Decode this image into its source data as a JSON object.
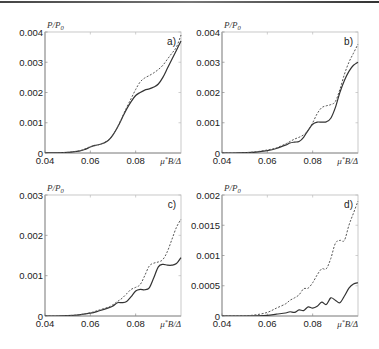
{
  "figure": {
    "top_rule": true
  },
  "chart_data": [
    {
      "type": "line",
      "panel": "a)",
      "title": "",
      "xlabel": "μ*B/Δ",
      "ylabel": "P/P0",
      "xlim": [
        0.04,
        0.1
      ],
      "ylim": [
        0,
        0.004
      ],
      "xticks": [
        "0.04",
        "0.06",
        "0.08"
      ],
      "xtick_values": [
        0.04,
        0.06,
        0.08
      ],
      "yticks": [
        "0",
        "0.001",
        "0.002",
        "0.003",
        "0.004"
      ],
      "ytick_values": [
        0,
        0.001,
        0.002,
        0.003,
        0.004
      ],
      "grid": false,
      "box": {
        "left": 45,
        "right": 181,
        "top": 32,
        "bottom": 153
      },
      "series": [
        {
          "name": "solid",
          "style": "solid",
          "x": [
            0.04,
            0.045,
            0.05,
            0.055,
            0.058,
            0.06,
            0.062,
            0.064,
            0.066,
            0.068,
            0.07,
            0.072,
            0.074,
            0.076,
            0.078,
            0.08,
            0.082,
            0.084,
            0.086,
            0.088,
            0.09,
            0.092,
            0.094,
            0.096,
            0.098,
            0.1
          ],
          "y": [
            0.0,
            5e-06,
            2e-05,
            6e-05,
            0.00013,
            0.0002,
            0.00025,
            0.00028,
            0.00033,
            0.00042,
            0.0006,
            0.00085,
            0.00115,
            0.00145,
            0.0017,
            0.0019,
            0.002,
            0.00208,
            0.00212,
            0.00218,
            0.00228,
            0.0025,
            0.0028,
            0.0031,
            0.0034,
            0.0037
          ]
        },
        {
          "name": "dashed",
          "style": "dashed",
          "x": [
            0.04,
            0.045,
            0.05,
            0.055,
            0.058,
            0.06,
            0.062,
            0.064,
            0.066,
            0.068,
            0.07,
            0.072,
            0.074,
            0.076,
            0.078,
            0.08,
            0.082,
            0.084,
            0.086,
            0.088,
            0.09,
            0.092,
            0.094,
            0.096,
            0.098,
            0.1
          ],
          "y": [
            0.0,
            5e-06,
            2e-05,
            7e-05,
            0.00015,
            0.00021,
            0.00024,
            0.00028,
            0.00034,
            0.00043,
            0.0006,
            0.00086,
            0.00118,
            0.0015,
            0.0018,
            0.0021,
            0.00235,
            0.00248,
            0.00256,
            0.00265,
            0.00276,
            0.0029,
            0.0031,
            0.0033,
            0.0035,
            0.0039
          ]
        }
      ]
    },
    {
      "type": "line",
      "panel": "b)",
      "title": "",
      "xlabel": "μ*B/Δ",
      "ylabel": "P/P0",
      "xlim": [
        0.04,
        0.1
      ],
      "ylim": [
        0,
        0.004
      ],
      "xticks": [
        "0.04",
        "0.06",
        "0.08"
      ],
      "xtick_values": [
        0.04,
        0.06,
        0.08
      ],
      "yticks": [
        "0",
        "0.001",
        "0.002",
        "0.003",
        "0.004"
      ],
      "ytick_values": [
        0,
        0.001,
        0.002,
        0.003,
        0.004
      ],
      "grid": false,
      "box": {
        "left": 222,
        "right": 358,
        "top": 32,
        "bottom": 153
      },
      "series": [
        {
          "name": "solid",
          "style": "solid",
          "x": [
            0.04,
            0.045,
            0.05,
            0.055,
            0.06,
            0.064,
            0.068,
            0.07,
            0.072,
            0.074,
            0.076,
            0.078,
            0.08,
            0.082,
            0.084,
            0.086,
            0.088,
            0.09,
            0.092,
            0.094,
            0.096,
            0.098,
            0.1
          ],
          "y": [
            0.0,
            0.0,
            1e-05,
            3e-05,
            8e-05,
            0.00015,
            0.00026,
            0.00033,
            0.00036,
            0.00038,
            0.00052,
            0.00075,
            0.00095,
            0.00102,
            0.00102,
            0.00103,
            0.00115,
            0.0015,
            0.002,
            0.0024,
            0.0027,
            0.0029,
            0.003
          ]
        },
        {
          "name": "dashed",
          "style": "dashed",
          "x": [
            0.04,
            0.045,
            0.05,
            0.055,
            0.06,
            0.064,
            0.068,
            0.07,
            0.072,
            0.074,
            0.076,
            0.078,
            0.08,
            0.082,
            0.084,
            0.086,
            0.088,
            0.09,
            0.092,
            0.094,
            0.096,
            0.098,
            0.1
          ],
          "y": [
            0.0,
            0.0,
            1e-05,
            4e-05,
            0.0001,
            0.00017,
            0.0003,
            0.00038,
            0.00046,
            0.00052,
            0.0006,
            0.00075,
            0.001,
            0.0013,
            0.0015,
            0.00156,
            0.0016,
            0.0017,
            0.0021,
            0.0026,
            0.003,
            0.0033,
            0.0036
          ]
        }
      ]
    },
    {
      "type": "line",
      "panel": "c)",
      "title": "",
      "xlabel": "μ*B/Δ",
      "ylabel": "P/P0",
      "xlim": [
        0.04,
        0.1
      ],
      "ylim": [
        0,
        0.003
      ],
      "xticks": [
        "0.04",
        "0.06",
        "0.08"
      ],
      "xtick_values": [
        0.04,
        0.06,
        0.08
      ],
      "yticks": [
        "0",
        "0.001",
        "0.002",
        "0.003"
      ],
      "ytick_values": [
        0,
        0.001,
        0.002,
        0.003
      ],
      "grid": false,
      "box": {
        "left": 45,
        "right": 181,
        "top": 195,
        "bottom": 316
      },
      "series": [
        {
          "name": "solid",
          "style": "solid",
          "x": [
            0.04,
            0.045,
            0.05,
            0.055,
            0.06,
            0.064,
            0.068,
            0.07,
            0.072,
            0.074,
            0.076,
            0.078,
            0.08,
            0.082,
            0.084,
            0.086,
            0.088,
            0.09,
            0.092,
            0.094,
            0.096,
            0.098,
            0.1
          ],
          "y": [
            0.0,
            0.0,
            1e-05,
            3e-05,
            7e-05,
            0.00013,
            0.0002,
            0.00025,
            0.00033,
            0.00033,
            0.00036,
            0.00048,
            0.00062,
            0.00066,
            0.00065,
            0.0007,
            0.00095,
            0.00122,
            0.00128,
            0.00126,
            0.00126,
            0.0013,
            0.00145
          ]
        },
        {
          "name": "dashed",
          "style": "dashed",
          "x": [
            0.04,
            0.045,
            0.05,
            0.055,
            0.06,
            0.064,
            0.068,
            0.07,
            0.072,
            0.074,
            0.076,
            0.078,
            0.08,
            0.082,
            0.084,
            0.086,
            0.088,
            0.09,
            0.092,
            0.094,
            0.096,
            0.098,
            0.1
          ],
          "y": [
            0.0,
            0.0,
            1e-05,
            3e-05,
            8e-05,
            0.00015,
            0.00022,
            0.00028,
            0.00036,
            0.00044,
            0.00055,
            0.00066,
            0.00071,
            0.00078,
            0.001,
            0.00124,
            0.00131,
            0.00134,
            0.0014,
            0.0016,
            0.0019,
            0.0022,
            0.0024
          ]
        }
      ]
    },
    {
      "type": "line",
      "panel": "d)",
      "title": "",
      "xlabel": "μ*B/Δ",
      "ylabel": "P/P0",
      "xlim": [
        0.04,
        0.1
      ],
      "ylim": [
        0,
        0.002
      ],
      "xticks": [
        "0.04",
        "0.06",
        "0.08"
      ],
      "xtick_values": [
        0.04,
        0.06,
        0.08
      ],
      "yticks": [
        "0",
        "0.0005",
        "0.001",
        "0.0015",
        "0.002"
      ],
      "ytick_values": [
        0,
        0.0005,
        0.001,
        0.0015,
        0.002
      ],
      "grid": false,
      "box": {
        "left": 222,
        "right": 358,
        "top": 195,
        "bottom": 316
      },
      "series": [
        {
          "name": "solid",
          "style": "solid",
          "x": [
            0.04,
            0.05,
            0.055,
            0.06,
            0.064,
            0.068,
            0.07,
            0.072,
            0.074,
            0.076,
            0.078,
            0.08,
            0.082,
            0.084,
            0.086,
            0.088,
            0.09,
            0.092,
            0.094,
            0.096,
            0.098,
            0.1
          ],
          "y": [
            0.0,
            0.0,
            3e-06,
            1e-05,
            3e-05,
            5e-05,
            7e-05,
            6e-05,
            0.0001,
            9e-05,
            0.00015,
            0.00013,
            0.00016,
            0.00023,
            0.00019,
            0.0003,
            0.00026,
            0.00022,
            0.00033,
            0.00046,
            0.00053,
            0.00055
          ]
        },
        {
          "name": "dashed",
          "style": "dashed",
          "x": [
            0.04,
            0.05,
            0.055,
            0.06,
            0.064,
            0.068,
            0.07,
            0.072,
            0.074,
            0.076,
            0.078,
            0.08,
            0.082,
            0.084,
            0.086,
            0.088,
            0.09,
            0.092,
            0.094,
            0.096,
            0.098,
            0.1
          ],
          "y": [
            0.0,
            5e-06,
            2e-05,
            6e-05,
            0.00013,
            0.0002,
            0.00026,
            0.0003,
            0.00035,
            0.00045,
            0.00046,
            0.00055,
            0.00068,
            0.00078,
            0.00078,
            0.00095,
            0.0012,
            0.00125,
            0.00125,
            0.0015,
            0.0017,
            0.0019
          ]
        }
      ]
    }
  ]
}
